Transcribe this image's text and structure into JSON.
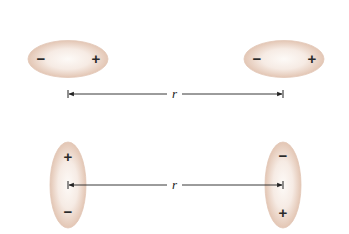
{
  "diagram": {
    "colors": {
      "molecule_fill_center": "#fbf6f2",
      "molecule_fill_edge": "#e6cbbb",
      "molecule_stroke": "#dcbba6",
      "line": "#222222",
      "text": "#222222"
    },
    "top_row": {
      "label": "r",
      "left_molecule": {
        "orientation": "horizontal",
        "left_sign": "−",
        "right_sign": "+"
      },
      "right_molecule": {
        "orientation": "horizontal",
        "left_sign": "−",
        "right_sign": "+"
      }
    },
    "bottom_row": {
      "label": "r",
      "left_molecule": {
        "orientation": "vertical",
        "top_sign": "+",
        "bottom_sign": "−"
      },
      "right_molecule": {
        "orientation": "vertical",
        "top_sign": "−",
        "bottom_sign": "+"
      }
    }
  }
}
